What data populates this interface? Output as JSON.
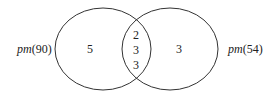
{
  "diagram": {
    "type": "venn",
    "sets": [
      {
        "name": "pm",
        "arg": "(90)",
        "label": "pm(90)",
        "only_count": "5"
      },
      {
        "name": "pm",
        "arg": "(54)",
        "label": "pm(54)",
        "only_count": "3"
      }
    ],
    "intersection": [
      "2",
      "3",
      "3"
    ],
    "stroke_color": "#333333"
  }
}
